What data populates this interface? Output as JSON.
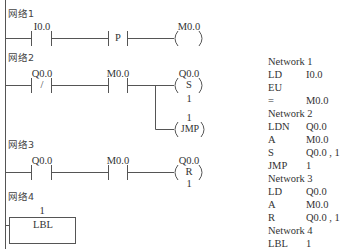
{
  "ladder": {
    "networks": [
      {
        "title": "网络1",
        "elements": [
          {
            "type": "NO-contact",
            "address": "I0.0"
          },
          {
            "type": "positive-edge",
            "symbol": "P"
          },
          {
            "type": "coil",
            "address": "M0.0",
            "symbol": ""
          }
        ]
      },
      {
        "title": "网络2",
        "elements": [
          {
            "type": "NC-contact",
            "address": "Q0.0",
            "symbol": "/"
          },
          {
            "type": "NO-contact",
            "address": "M0.0"
          },
          {
            "type": "set-coil",
            "address": "Q0.0",
            "symbol": "S",
            "count": "1"
          },
          {
            "type": "jump-coil",
            "label": "1",
            "symbol": "JMP"
          }
        ]
      },
      {
        "title": "网络3",
        "elements": [
          {
            "type": "NO-contact",
            "address": "Q0.0"
          },
          {
            "type": "NO-contact",
            "address": "M0.0"
          },
          {
            "type": "reset-coil",
            "address": "Q0.0",
            "symbol": "R",
            "count": "1"
          }
        ]
      },
      {
        "title": "网络4",
        "elements": [
          {
            "type": "label-box",
            "label": "1",
            "symbol": "LBL"
          }
        ]
      }
    ]
  },
  "instruction_list": {
    "networks": [
      {
        "title": "Network 1",
        "lines": [
          {
            "op": "LD",
            "operand": "I0.0"
          },
          {
            "op": "EU",
            "operand": ""
          },
          {
            "op": "=",
            "operand": "M0.0"
          }
        ]
      },
      {
        "title": "Network 2",
        "lines": [
          {
            "op": "LDN",
            "operand": "Q0.0"
          },
          {
            "op": "A",
            "operand": "M0.0"
          },
          {
            "op": "S",
            "operand": "Q0.0 , 1"
          },
          {
            "op": "JMP",
            "operand": "1"
          }
        ]
      },
      {
        "title": "Network 3",
        "lines": [
          {
            "op": "LD",
            "operand": "Q0.0"
          },
          {
            "op": "A",
            "operand": "M0.0"
          },
          {
            "op": "R",
            "operand": "Q0.0 , 1"
          }
        ]
      },
      {
        "title": "Network 4",
        "lines": [
          {
            "op": "LBL",
            "operand": "1"
          }
        ]
      }
    ]
  }
}
